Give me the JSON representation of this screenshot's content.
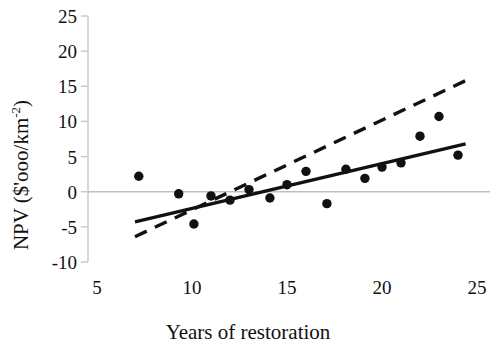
{
  "chart_data": {
    "type": "scatter",
    "title": "",
    "xlabel": "Years of restoration",
    "ylabel": "NPV ($'ooo/km-2)",
    "ylabel_base": "NPV ($'ooo/km",
    "ylabel_sup": "-2",
    "ylabel_tail": ")",
    "xlim": [
      5,
      25
    ],
    "ylim": [
      -10,
      25
    ],
    "xticks": [
      5,
      10,
      15,
      20,
      25
    ],
    "yticks": [
      25,
      20,
      15,
      10,
      5,
      0,
      -5,
      -10
    ],
    "xtick_labels": [
      "5",
      "10",
      "15",
      "20",
      "25"
    ],
    "ytick_labels": [
      "25",
      "20",
      "15",
      "10",
      "5",
      "0",
      "-5",
      "-10"
    ],
    "grid": false,
    "zero_line": true,
    "zero_line_color": "#bfbfbf",
    "axis_color": "#c8c8c8",
    "legend": null,
    "legend_position": "none",
    "marker_color": "#111111",
    "marker_size": 7,
    "x": [
      7.2,
      9.3,
      10.1,
      11.0,
      12.0,
      13.0,
      14.1,
      15.0,
      16.0,
      17.1,
      18.1,
      19.1,
      20.0,
      21.0,
      22.0,
      23.0,
      24.0
    ],
    "y": [
      2.2,
      -0.3,
      -4.6,
      -0.6,
      -1.2,
      0.3,
      -0.9,
      1.0,
      2.9,
      -1.7,
      3.2,
      1.9,
      3.5,
      4.1,
      7.9,
      10.7,
      5.2
    ],
    "points": [
      {
        "x": 7.2,
        "y": 2.2
      },
      {
        "x": 9.3,
        "y": -0.3
      },
      {
        "x": 10.1,
        "y": -4.6
      },
      {
        "x": 11.0,
        "y": -0.6
      },
      {
        "x": 12.0,
        "y": -1.2
      },
      {
        "x": 13.0,
        "y": 0.3
      },
      {
        "x": 14.1,
        "y": -0.9
      },
      {
        "x": 15.0,
        "y": 1.0
      },
      {
        "x": 16.0,
        "y": 2.9
      },
      {
        "x": 17.1,
        "y": -1.7
      },
      {
        "x": 18.1,
        "y": 3.2
      },
      {
        "x": 19.1,
        "y": 1.9
      },
      {
        "x": 20.0,
        "y": 3.5
      },
      {
        "x": 21.0,
        "y": 4.1
      },
      {
        "x": 22.0,
        "y": 7.9
      },
      {
        "x": 23.0,
        "y": 10.7
      },
      {
        "x": 24.0,
        "y": 5.2
      }
    ],
    "series": [
      {
        "name": "solid-trend-line",
        "style": "solid",
        "color": "#111111",
        "width": 3.4,
        "x": [
          7.0,
          24.4
        ],
        "y": [
          -4.3,
          6.8
        ]
      },
      {
        "name": "dashed-trend-line",
        "style": "dashed",
        "color": "#111111",
        "width": 3.4,
        "dash": "13,9",
        "x": [
          7.0,
          24.4
        ],
        "y": [
          -6.4,
          15.8
        ]
      }
    ]
  }
}
